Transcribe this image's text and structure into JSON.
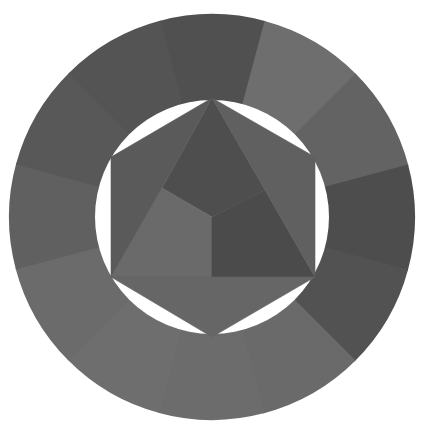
{
  "diagram": {
    "type": "color-wheel",
    "rendering": "grayscale",
    "center": [
      212,
      217
    ],
    "outer_radius": 203,
    "inner_radius": 117,
    "background": "#ffffff",
    "ring": {
      "segment_count": 12,
      "start_angle_deg": -15,
      "segments": [
        {
          "name": "ring-segment-1",
          "shade": "#505050"
        },
        {
          "name": "ring-segment-2",
          "shade": "#6e6e6e"
        },
        {
          "name": "ring-segment-3",
          "shade": "#636363"
        },
        {
          "name": "ring-segment-4",
          "shade": "#4d4d4d"
        },
        {
          "name": "ring-segment-5",
          "shade": "#525252"
        },
        {
          "name": "ring-segment-6",
          "shade": "#6a6a6a"
        },
        {
          "name": "ring-segment-7",
          "shade": "#6c6c6c"
        },
        {
          "name": "ring-segment-8",
          "shade": "#6e6e6e"
        },
        {
          "name": "ring-segment-9",
          "shade": "#6b6b6b"
        },
        {
          "name": "ring-segment-10",
          "shade": "#606060"
        },
        {
          "name": "ring-segment-11",
          "shade": "#585858"
        },
        {
          "name": "ring-segment-12",
          "shade": "#545454"
        }
      ]
    },
    "hexagon": {
      "vertices": [
        [
          212,
          98
        ],
        [
          315,
          157
        ],
        [
          315,
          277
        ],
        [
          212,
          337
        ],
        [
          111,
          277
        ],
        [
          111,
          157
        ]
      ],
      "center_point": [
        212,
        217
      ],
      "pieces": [
        {
          "name": "primary-triangle-top",
          "shade": "#4e4e4e",
          "points": [
            [
              212,
              98
            ],
            [
              265,
              190
            ],
            [
              212,
              217
            ],
            [
              162,
              188
            ]
          ]
        },
        {
          "name": "primary-triangle-left",
          "shade": "#6a6a6a",
          "points": [
            [
              162,
              188
            ],
            [
              212,
              217
            ],
            [
              212,
              277
            ],
            [
              111,
              277
            ]
          ]
        },
        {
          "name": "primary-triangle-right",
          "shade": "#4b4b4b",
          "points": [
            [
              212,
              217
            ],
            [
              265,
              190
            ],
            [
              315,
              277
            ],
            [
              212,
              277
            ]
          ]
        },
        {
          "name": "secondary-triangle-upper-left",
          "shade": "#5a5a5a",
          "points": [
            [
              212,
              98
            ],
            [
              162,
              188
            ],
            [
              111,
              277
            ],
            [
              111,
              157
            ]
          ]
        },
        {
          "name": "secondary-triangle-upper-right",
          "shade": "#606060",
          "points": [
            [
              212,
              98
            ],
            [
              315,
              157
            ],
            [
              315,
              277
            ],
            [
              265,
              190
            ]
          ]
        },
        {
          "name": "secondary-triangle-bottom",
          "shade": "#666666",
          "points": [
            [
              111,
              277
            ],
            [
              315,
              277
            ],
            [
              212,
              337
            ]
          ]
        }
      ]
    }
  }
}
